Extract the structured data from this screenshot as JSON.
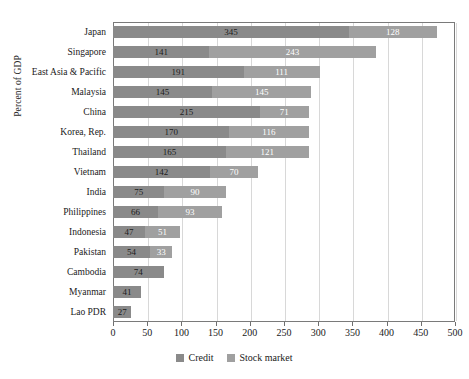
{
  "chart_data": {
    "type": "bar",
    "orientation": "horizontal",
    "stacked": true,
    "title": "",
    "xlabel": "",
    "ylabel": "Percent of GDP",
    "xlim": [
      0,
      500
    ],
    "xticks": [
      0,
      50,
      100,
      150,
      200,
      250,
      300,
      350,
      400,
      450,
      500
    ],
    "xtick_labels": [
      "0",
      "50",
      "100",
      "150",
      "200",
      "250",
      "300",
      "350",
      "400",
      "450",
      "500"
    ],
    "grid": true,
    "legend_position": "bottom",
    "categories": [
      "Japan",
      "Singapore",
      "East Asia & Pacific",
      "Malaysia",
      "China",
      "Korea, Rep.",
      "Thailand",
      "Vietnam",
      "India",
      "Philippines",
      "Indonesia",
      "Pakistan",
      "Cambodia",
      "Myanmar",
      "Lao PDR"
    ],
    "series": [
      {
        "name": "Credit",
        "color": "#8a8a8a",
        "values": [
          345,
          141,
          191,
          145,
          215,
          170,
          165,
          142,
          75,
          66,
          47,
          54,
          74,
          41,
          27
        ]
      },
      {
        "name": "Stock market",
        "color": "#a0a0a0",
        "values": [
          128,
          243,
          111,
          145,
          71,
          116,
          121,
          70,
          90,
          93,
          51,
          33,
          null,
          null,
          null
        ]
      }
    ]
  },
  "legend": {
    "items": [
      {
        "label": "Credit",
        "color": "#8a8a8a"
      },
      {
        "label": "Stock market",
        "color": "#a0a0a0"
      }
    ]
  }
}
